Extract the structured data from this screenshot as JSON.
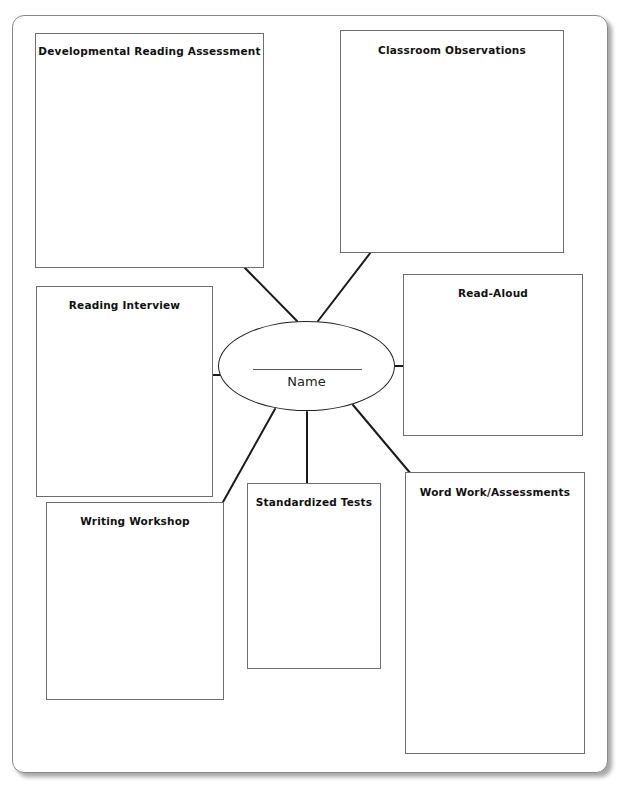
{
  "worksheet": {
    "center": {
      "label": "Name",
      "blank_line": ""
    },
    "boxes": [
      {
        "id": "dra",
        "title": "Developmental Reading Assessment"
      },
      {
        "id": "classroom-observations",
        "title": "Classroom Observations"
      },
      {
        "id": "reading-interview",
        "title": "Reading Interview"
      },
      {
        "id": "read-aloud",
        "title": "Read-Aloud"
      },
      {
        "id": "writing-workshop",
        "title": "Writing Workshop"
      },
      {
        "id": "standardized-tests",
        "title": "Standardized Tests"
      },
      {
        "id": "word-work",
        "title": "Word Work/Assessments"
      }
    ],
    "colors": {
      "line": "#1a1a1a",
      "box_border": "#6e6e6e",
      "background": "#ffffff"
    }
  }
}
